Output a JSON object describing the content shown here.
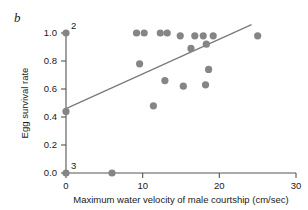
{
  "panel": {
    "label": "b"
  },
  "chart_data": {
    "type": "scatter",
    "title": "",
    "xlabel": "Maximum water velocity of male courtship (cm/sec)",
    "ylabel": "Egg survival rate",
    "xlim": [
      0,
      30
    ],
    "ylim": [
      0.0,
      1.0
    ],
    "xticks": [
      0,
      10,
      20,
      30
    ],
    "xtick_labels": [
      "0",
      "10",
      "20",
      "30"
    ],
    "yticks": [
      0.0,
      0.2,
      0.4,
      0.6,
      0.8,
      1.0
    ],
    "ytick_labels": [
      "0.0",
      "0.2",
      "0.4",
      "0.6",
      "0.8",
      "1.0"
    ],
    "grid": false,
    "legend": null,
    "marker_color": "#858585",
    "line_color": "#7a7a7a",
    "points": [
      {
        "x": 0.0,
        "y": 1.0
      },
      {
        "x": 0.0,
        "y": 0.44
      },
      {
        "x": 0.0,
        "y": 0.0
      },
      {
        "x": 6.0,
        "y": 0.0
      },
      {
        "x": 9.2,
        "y": 1.0
      },
      {
        "x": 10.2,
        "y": 1.0
      },
      {
        "x": 12.3,
        "y": 1.0
      },
      {
        "x": 13.2,
        "y": 1.0
      },
      {
        "x": 14.9,
        "y": 0.98
      },
      {
        "x": 9.6,
        "y": 0.78
      },
      {
        "x": 11.4,
        "y": 0.48
      },
      {
        "x": 12.9,
        "y": 0.66
      },
      {
        "x": 16.3,
        "y": 0.89
      },
      {
        "x": 16.8,
        "y": 0.98
      },
      {
        "x": 17.9,
        "y": 0.98
      },
      {
        "x": 19.2,
        "y": 0.98
      },
      {
        "x": 18.3,
        "y": 0.92
      },
      {
        "x": 18.6,
        "y": 0.74
      },
      {
        "x": 18.2,
        "y": 0.63
      },
      {
        "x": 15.3,
        "y": 0.62
      },
      {
        "x": 25.0,
        "y": 0.98
      }
    ],
    "fit_line": {
      "x_start": 0.0,
      "y_start": 0.46,
      "x_end": 24.2,
      "y_end": 1.06
    },
    "annotations": [
      {
        "text": "2",
        "x": 0.0,
        "y": 1.0,
        "note": "overlapping-point-count"
      },
      {
        "text": "3",
        "x": 0.0,
        "y": 0.0,
        "note": "overlapping-point-count"
      }
    ]
  }
}
